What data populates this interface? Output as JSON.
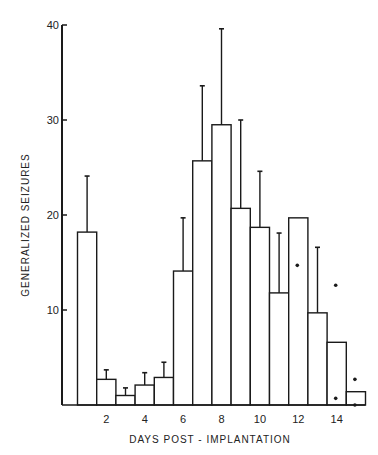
{
  "chart_data": {
    "type": "bar",
    "title": "",
    "xlabel": "DAYS POST - IMPLANTATION",
    "ylabel": "GENERALIZED SEIZURES",
    "ylim": [
      0,
      40
    ],
    "yticks": [
      10,
      20,
      30,
      40
    ],
    "xtick_labels": [
      "2",
      "4",
      "6",
      "8",
      "10",
      "12",
      "14"
    ],
    "grid": false,
    "legend": null,
    "categories": [
      1,
      2,
      3,
      4,
      5,
      6,
      7,
      8,
      9,
      10,
      11,
      12,
      13,
      14,
      15
    ],
    "series": [
      {
        "name": "Mean generalized seizures",
        "values": [
          18.2,
          2.7,
          1.0,
          2.1,
          2.9,
          14.1,
          25.7,
          29.5,
          20.7,
          18.7,
          11.8,
          19.7,
          9.7,
          6.6,
          1.4
        ],
        "error_upper": [
          24.1,
          3.7,
          1.8,
          3.4,
          4.5,
          19.7,
          33.6,
          39.6,
          30.0,
          24.6,
          18.1,
          null,
          16.6,
          null,
          null
        ]
      }
    ],
    "individual_points": [
      {
        "day": 12,
        "value": 14.7
      },
      {
        "day": 14,
        "value": 12.6
      },
      {
        "day": 14,
        "value": 0.7
      },
      {
        "day": 15,
        "value": 2.7
      },
      {
        "day": 15,
        "value": 0.0
      }
    ]
  }
}
